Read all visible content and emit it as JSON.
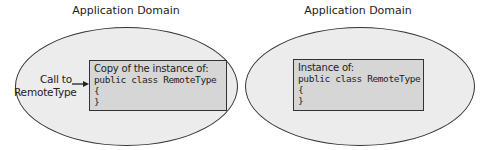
{
  "diagram": {
    "left_domain": {
      "title": "Application Domain",
      "call_label_line1": "Call to",
      "call_label_line2": "RemoteType",
      "box": {
        "header": "Copy of the instance of:",
        "code": [
          "public class RemoteType",
          "{",
          "}"
        ]
      }
    },
    "right_domain": {
      "title": "Application Domain",
      "box": {
        "header": "Instance of:",
        "code": [
          "public class RemoteType",
          "{",
          "}"
        ]
      }
    },
    "colors": {
      "ellipse_fill": "#ececec",
      "box_fill": "#d6d6d6",
      "stroke": "#333333"
    }
  }
}
